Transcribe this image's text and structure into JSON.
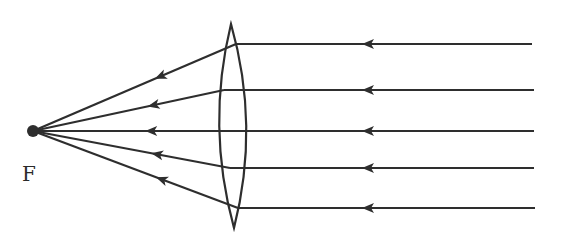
{
  "diagram": {
    "focus_label": "F",
    "colors": {
      "stroke": "#2e2e2e",
      "background": "#ffffff"
    },
    "focus_point": {
      "x": 33,
      "y": 131
    },
    "lens": {
      "top": [
        231,
        24
      ],
      "bottom": [
        234,
        228
      ],
      "left_x": 220,
      "right_x": 246
    },
    "rays": [
      {
        "y": 44,
        "lens_x": 236,
        "end_x": 532
      },
      {
        "y": 90,
        "lens_x": 224,
        "end_x": 534
      },
      {
        "y": 131,
        "lens_x": 220,
        "end_x": 534
      },
      {
        "y": 168,
        "lens_x": 230,
        "end_x": 534
      },
      {
        "y": 208,
        "lens_x": 238,
        "end_x": 535
      }
    ]
  }
}
